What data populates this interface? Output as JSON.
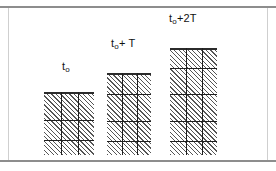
{
  "figure": {
    "background_color": "#ffffff",
    "frame_color": "#8d8d8d",
    "width": 276,
    "height": 171
  },
  "style": {
    "hatch_color": "#555555",
    "grid_color": "#1f1f1f",
    "cap_color": "#2b2b2b",
    "label_color": "#111111"
  },
  "chart_data": {
    "type": "bar",
    "title": "",
    "xlabel": "",
    "ylabel": "",
    "categories": [
      "t_0",
      "t_0+T",
      "t_0+2T"
    ],
    "values": [
      63,
      82,
      107
    ],
    "ylim": [
      0,
      115
    ],
    "grid": true,
    "legend": "none"
  },
  "bars": [
    {
      "id": "bar-t0",
      "label_main": "t",
      "label_sub": "o",
      "label_suffix": "",
      "label_text": "t₀",
      "left": 44,
      "top": 92,
      "width": 50,
      "height": 63,
      "label_left": 62,
      "label_top": 60,
      "v_gridlines": [
        17,
        34
      ],
      "h_gridlines": [
        28,
        48
      ]
    },
    {
      "id": "bar-t0-plus-T",
      "label_main": "t",
      "label_sub": "o",
      "label_suffix": "+ T",
      "label_text": "t₀+ T",
      "left": 107,
      "top": 73,
      "width": 44,
      "height": 82,
      "label_left": 111,
      "label_top": 37,
      "v_gridlines": [
        15,
        30
      ],
      "h_gridlines": [
        21,
        48,
        68
      ]
    },
    {
      "id": "bar-t0-plus-2T",
      "label_main": "t",
      "label_sub": "o",
      "label_suffix": "+2T",
      "label_text": "t₀+2T",
      "left": 170,
      "top": 48,
      "width": 47,
      "height": 107,
      "label_left": 169,
      "label_top": 12,
      "v_gridlines": [
        16,
        32
      ],
      "h_gridlines": [
        20,
        46,
        73,
        93
      ]
    }
  ]
}
